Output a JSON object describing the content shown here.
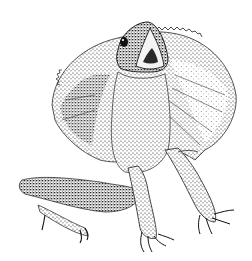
{
  "image": {
    "subject": "frilled lizard",
    "style": "black and white stipple illustration",
    "background": "#ffffff",
    "ink": "#1a1a1a",
    "alt": "Stipple drawing of a frilled lizard with its frill spread and mouth open, standing on its front legs"
  }
}
